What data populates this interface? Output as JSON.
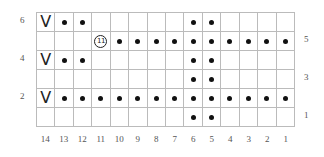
{
  "chart_title": "",
  "columns": [
    "14",
    "13",
    "12",
    "11",
    "10",
    "9",
    "8",
    "7",
    "6",
    "5",
    "4",
    "3",
    "2",
    "1"
  ],
  "row_labels_left": [
    {
      "row": 6,
      "label": "6"
    },
    {
      "row": 4,
      "label": "4"
    },
    {
      "row": 2,
      "label": "2"
    }
  ],
  "row_labels_right": [
    {
      "row": 5,
      "label": "5"
    },
    {
      "row": 3,
      "label": "3"
    },
    {
      "row": 1,
      "label": "1"
    }
  ],
  "symbols": {
    "dot": "purl",
    "slip": "V",
    "circle": "11"
  },
  "rows": [
    {
      "row": 6,
      "cells": [
        "V",
        "dot",
        "dot",
        "",
        "",
        "",
        "",
        "",
        "dot",
        "dot",
        "",
        "",
        "",
        ""
      ]
    },
    {
      "row": 5,
      "cells": [
        "",
        "",
        "",
        "circle",
        "dot",
        "dot",
        "dot",
        "dot",
        "dot",
        "dot",
        "dot",
        "dot",
        "dot",
        "dot"
      ]
    },
    {
      "row": 4,
      "cells": [
        "V",
        "dot",
        "dot",
        "",
        "",
        "",
        "",
        "",
        "dot",
        "dot",
        "",
        "",
        "",
        ""
      ]
    },
    {
      "row": 3,
      "cells": [
        "",
        "",
        "",
        "",
        "",
        "",
        "",
        "",
        "dot",
        "dot",
        "",
        "",
        "",
        ""
      ]
    },
    {
      "row": 2,
      "cells": [
        "V",
        "dot",
        "dot",
        "dot",
        "dot",
        "dot",
        "dot",
        "dot",
        "dot",
        "dot",
        "dot",
        "dot",
        "dot",
        "dot"
      ]
    },
    {
      "row": 1,
      "cells": [
        "",
        "",
        "",
        "",
        "",
        "",
        "",
        "",
        "dot",
        "dot",
        "",
        "",
        "",
        ""
      ]
    }
  ],
  "labels": {
    "r6": "6",
    "r4": "4",
    "r2": "2",
    "r5": "5",
    "r3": "3",
    "r1": "1",
    "slip_glyph": "V",
    "circle_text": "11"
  }
}
